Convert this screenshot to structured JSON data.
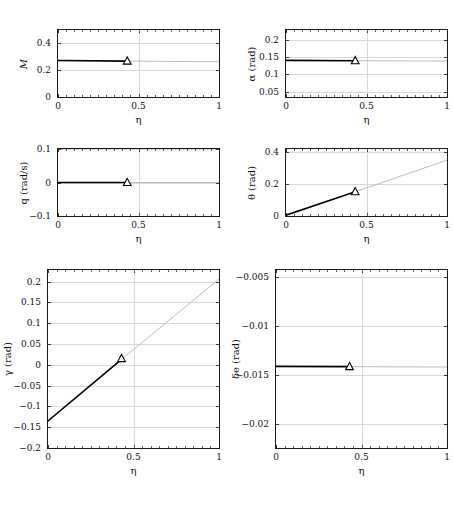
{
  "figure": {
    "background_color": "#ffffff",
    "axis_color": "#1a1a1a",
    "grid_color": "#d8d8d8",
    "solid_line_color": "#000000",
    "faint_line_color": "#b4b4b4",
    "marker_edge_color": "#000000",
    "marker_face_color": "#ffffff",
    "marker_symbol": "open-triangle-up",
    "n_rows": 3,
    "n_cols": 2,
    "shared_xlabel": "η",
    "split_eta": 0.43
  },
  "chart_data": [
    {
      "type": "line",
      "panel": "top-left",
      "title": "",
      "xlabel": "η",
      "ylabel": "M",
      "xlim": [
        0,
        1
      ],
      "ylim": [
        0,
        0.5
      ],
      "xticks": [
        0,
        0.5,
        1
      ],
      "xticklabels": [
        "0",
        "0.5",
        "1"
      ],
      "yticks": [
        0,
        0.2,
        0.4
      ],
      "yticklabels": [
        "0",
        "0.2",
        "0.4"
      ],
      "grid": true,
      "legend": "none",
      "series": [
        {
          "name": "solved-segment",
          "style": "solid",
          "x": [
            0,
            0.43
          ],
          "y": [
            0.272,
            0.268
          ]
        },
        {
          "name": "extrapolated-segment",
          "style": "faint",
          "x": [
            0.43,
            1
          ],
          "y": [
            0.268,
            0.263
          ]
        }
      ],
      "markers": [
        {
          "x": 0.43,
          "y": 0.268,
          "symbol": "open-triangle-up"
        }
      ]
    },
    {
      "type": "line",
      "panel": "top-right",
      "title": "",
      "xlabel": "η",
      "ylabel": "α (rad)",
      "xlim": [
        0,
        1
      ],
      "ylim": [
        0.035,
        0.228
      ],
      "xticks": [
        0,
        0.5,
        1
      ],
      "xticklabels": [
        "0",
        "0.5",
        "1"
      ],
      "yticks": [
        0.05,
        0.1,
        0.15,
        0.2
      ],
      "yticklabels": [
        "0.05",
        "0.1",
        "0.15",
        "0.2"
      ],
      "grid": true,
      "legend": "none",
      "series": [
        {
          "name": "solved-segment",
          "style": "solid",
          "x": [
            0,
            0.43
          ],
          "y": [
            0.1405,
            0.1395
          ]
        },
        {
          "name": "extrapolated-segment",
          "style": "faint",
          "x": [
            0.43,
            1
          ],
          "y": [
            0.1395,
            0.1385
          ]
        }
      ],
      "markers": [
        {
          "x": 0.43,
          "y": 0.1395,
          "symbol": "open-triangle-up"
        }
      ]
    },
    {
      "type": "line",
      "panel": "middle-left",
      "title": "",
      "xlabel": "η",
      "ylabel": "q (rad/s)",
      "xlim": [
        0,
        1
      ],
      "ylim": [
        -0.1,
        0.1
      ],
      "xticks": [
        0,
        0.5,
        1
      ],
      "xticklabels": [
        "0",
        "0.5",
        "1"
      ],
      "yticks": [
        -0.1,
        0,
        0.1
      ],
      "yticklabels": [
        "−0.1",
        "0",
        "0.1"
      ],
      "grid": true,
      "legend": "none",
      "series": [
        {
          "name": "solved-segment",
          "style": "solid",
          "x": [
            0,
            0.43
          ],
          "y": [
            0,
            0
          ]
        },
        {
          "name": "extrapolated-segment",
          "style": "faint",
          "x": [
            0.43,
            1
          ],
          "y": [
            0,
            0
          ]
        }
      ],
      "markers": [
        {
          "x": 0.43,
          "y": 0,
          "symbol": "open-triangle-up"
        }
      ]
    },
    {
      "type": "line",
      "panel": "middle-right",
      "title": "",
      "xlabel": "η",
      "ylabel": "θ (rad)",
      "xlim": [
        0,
        1
      ],
      "ylim": [
        0,
        0.42
      ],
      "xticks": [
        0,
        0.5,
        1
      ],
      "xticklabels": [
        "0",
        "0.5",
        "1"
      ],
      "yticks": [
        0,
        0.2,
        0.4
      ],
      "yticklabels": [
        "0",
        "0.2",
        "0.4"
      ],
      "grid": true,
      "legend": "none",
      "series": [
        {
          "name": "solved-segment",
          "style": "solid",
          "x": [
            0,
            0.43
          ],
          "y": [
            0.005,
            0.152
          ]
        },
        {
          "name": "extrapolated-segment",
          "style": "faint",
          "x": [
            0.43,
            1
          ],
          "y": [
            0.152,
            0.35
          ]
        }
      ],
      "markers": [
        {
          "x": 0.43,
          "y": 0.152,
          "symbol": "open-triangle-up"
        }
      ]
    },
    {
      "type": "line",
      "panel": "bottom-left",
      "title": "",
      "xlabel": "η",
      "ylabel": "γ (rad)",
      "xlim": [
        0,
        1
      ],
      "ylim": [
        -0.2,
        0.228
      ],
      "xticks": [
        0,
        0.5,
        1
      ],
      "xticklabels": [
        "0",
        "0.5",
        "1"
      ],
      "yticks": [
        -0.2,
        -0.15,
        -0.1,
        -0.05,
        0,
        0.05,
        0.1,
        0.15,
        0.2
      ],
      "yticklabels": [
        "−0.2",
        "−0.15",
        "−0.1",
        "−0.05",
        "0",
        "0.05",
        "0.1",
        "0.15",
        "0.2"
      ],
      "grid": true,
      "legend": "none",
      "series": [
        {
          "name": "solved-segment",
          "style": "solid",
          "x": [
            0,
            0.43
          ],
          "y": [
            -0.135,
            0.013
          ]
        },
        {
          "name": "extrapolated-segment",
          "style": "faint",
          "x": [
            0.43,
            1
          ],
          "y": [
            0.013,
            0.206
          ]
        }
      ],
      "markers": [
        {
          "x": 0.43,
          "y": 0.015,
          "symbol": "open-triangle-up"
        }
      ]
    },
    {
      "type": "line",
      "panel": "bottom-right",
      "title": "",
      "xlabel": "η",
      "ylabel": "δe (rad)",
      "xlim": [
        0,
        1
      ],
      "ylim": [
        -0.0225,
        -0.0043
      ],
      "xticks": [
        0,
        0.5,
        1
      ],
      "xticklabels": [
        "0",
        "0.5",
        "1"
      ],
      "yticks": [
        -0.02,
        -0.015,
        -0.01,
        -0.005
      ],
      "yticklabels": [
        "−0.02",
        "−0.015",
        "−0.01",
        "−0.005"
      ],
      "grid": true,
      "legend": "none",
      "series": [
        {
          "name": "solved-segment",
          "style": "solid",
          "x": [
            0,
            0.43
          ],
          "y": [
            -0.01415,
            -0.01418
          ]
        },
        {
          "name": "extrapolated-segment",
          "style": "faint",
          "x": [
            0.43,
            1
          ],
          "y": [
            -0.01418,
            -0.01422
          ]
        }
      ],
      "markers": [
        {
          "x": 0.43,
          "y": -0.01418,
          "symbol": "open-triangle-up"
        }
      ]
    }
  ]
}
